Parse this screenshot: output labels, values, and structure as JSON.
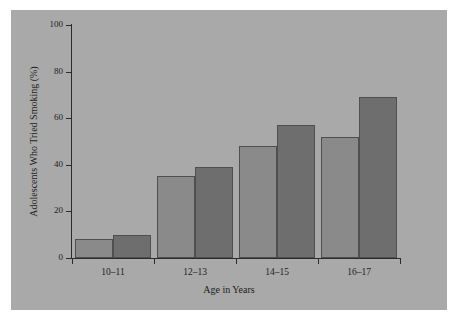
{
  "chart_data": {
    "type": "bar",
    "title": "",
    "xlabel": "Age in Years",
    "ylabel": "Adolescents Who Tried Smoking (%)",
    "categories": [
      "10–11",
      "12–13",
      "14–15",
      "16–17"
    ],
    "series": [
      {
        "name": "light",
        "color": "#8a8a8a",
        "values": [
          8,
          35,
          48,
          52
        ]
      },
      {
        "name": "dark",
        "color": "#6e6e6e",
        "values": [
          10,
          39,
          57,
          69
        ]
      }
    ],
    "ylim": [
      0,
      100
    ],
    "yticks": [
      0,
      20,
      40,
      60,
      80,
      100
    ],
    "ytick_labels": [
      "0",
      "20",
      "40",
      "60",
      "80",
      "100"
    ],
    "grid": false,
    "legend": "none",
    "background_color": "#a9a9a9",
    "axis_color": "#2b2b2b",
    "bar_edge_color": "#4f4f4f"
  }
}
